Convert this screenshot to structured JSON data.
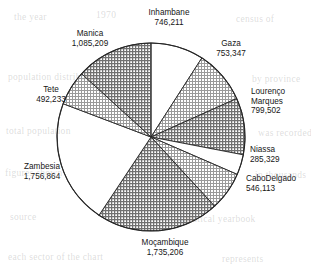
{
  "figure": {
    "background_color": "#ffffff",
    "outline_color": "#262626",
    "hatch_color": "#6f6f6f",
    "white_fill": "#ffffff",
    "center": {
      "x": 151,
      "y": 137
    },
    "radius": 94
  },
  "ghost_text": [
    {
      "text": "the year",
      "x": 14,
      "y": 12
    },
    {
      "text": "1970",
      "x": 96,
      "y": 10
    },
    {
      "text": "census of",
      "x": 236,
      "y": 14
    },
    {
      "text": "population distribution",
      "x": 8,
      "y": 72
    },
    {
      "text": "by province",
      "x": 252,
      "y": 74
    },
    {
      "text": "total population",
      "x": 6,
      "y": 126
    },
    {
      "text": "was recorded",
      "x": 258,
      "y": 128
    },
    {
      "text": "figures shown",
      "x": 5,
      "y": 168
    },
    {
      "text": "in thousands",
      "x": 255,
      "y": 170
    },
    {
      "text": "source",
      "x": 10,
      "y": 212
    },
    {
      "text": "statistical yearbook",
      "x": 176,
      "y": 214
    },
    {
      "text": "each sector of the chart",
      "x": 8,
      "y": 252
    },
    {
      "text": "represents",
      "x": 222,
      "y": 254
    }
  ],
  "chart_data": {
    "type": "pie",
    "title": "",
    "xlabel": "",
    "ylabel": "",
    "legend_position": "labels-around-pie",
    "grid": false,
    "start_angle_deg": -90,
    "direction": "clockwise",
    "total": 7653714,
    "categories": [
      "Inhambane",
      "Gaza",
      "Lourenço Marques",
      "Niassa",
      "CaboDelgado",
      "Moçambique",
      "Zambesia",
      "Tete",
      "Manica"
    ],
    "values": [
      746211,
      753347,
      799502,
      285329,
      546113,
      1735206,
      1756864,
      492233,
      1085209
    ],
    "slices": [
      {
        "label": "Inhambane",
        "value": 746211,
        "value_text": "746,211",
        "fill": "white",
        "label_lines": [
          "Inhambane",
          "746,211"
        ],
        "label_x": 169,
        "label_y": 15,
        "label_anchor": "middle"
      },
      {
        "label": "Gaza",
        "value": 753347,
        "value_text": "753,347",
        "fill": "hatch-light",
        "label_lines": [
          "Gaza",
          "753,347"
        ],
        "label_x": 231,
        "label_y": 46,
        "label_anchor": "middle"
      },
      {
        "label": "Lourenço Marques",
        "value": 799502,
        "value_text": "799,502",
        "fill": "hatch-dense",
        "label_lines": [
          "Lourenço",
          "Marques",
          "799,502"
        ],
        "label_x": 251,
        "label_y": 94,
        "label_anchor": "start"
      },
      {
        "label": "Niassa",
        "value": 285329,
        "value_text": "285,329",
        "fill": "white",
        "label_lines": [
          "Niassa",
          "285,329"
        ],
        "label_x": 250,
        "label_y": 152,
        "label_anchor": "start"
      },
      {
        "label": "CaboDelgado",
        "value": 546113,
        "value_text": "546,113",
        "fill": "hatch-light",
        "label_lines": [
          "CaboDelgado",
          "546,113"
        ],
        "label_x": 246,
        "label_y": 181,
        "label_anchor": "start"
      },
      {
        "label": "Moçambique",
        "value": 1735206,
        "value_text": "1,735,206",
        "fill": "hatch-dense",
        "label_lines": [
          "Moçambique",
          "1,735,206"
        ],
        "label_x": 165,
        "label_y": 245,
        "label_anchor": "middle"
      },
      {
        "label": "Zambesia",
        "value": 1756864,
        "value_text": "1,756,864",
        "fill": "white",
        "label_lines": [
          "Zambesia",
          "1,756,864"
        ],
        "label_x": 42,
        "label_y": 169,
        "label_anchor": "middle"
      },
      {
        "label": "Tete",
        "value": 492233,
        "value_text": "492,233",
        "fill": "hatch-light",
        "label_lines": [
          "Tete",
          "492,233"
        ],
        "label_x": 51,
        "label_y": 92,
        "label_anchor": "middle"
      },
      {
        "label": "Manica",
        "value": 1085209,
        "value_text": "1,085,209",
        "fill": "hatch-dense",
        "label_lines": [
          "Manica",
          "1,085,209"
        ],
        "label_x": 90,
        "label_y": 36,
        "label_anchor": "middle"
      }
    ]
  }
}
